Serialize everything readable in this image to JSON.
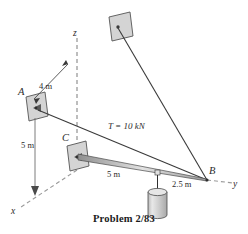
{
  "figure": {
    "caption": "Problem 2/83",
    "points": {
      "a": "A",
      "b": "B",
      "c": "C"
    },
    "axes": {
      "x": "x",
      "y": "y",
      "z": "z"
    },
    "dimensions": {
      "top_cable": "4 m",
      "vertical": "5 m",
      "boom": "5 m",
      "boom_outer": "2.5 m"
    },
    "force": {
      "tension": "T = 10 kN"
    },
    "colors": {
      "plate_fill": "#d4d4d4",
      "plate_stroke": "#555555",
      "line": "#3a3a3a",
      "axis_dash": "#9a9a9a",
      "cylinder_fill": "#cfcfcf",
      "text": "#2b2b2b"
    }
  }
}
